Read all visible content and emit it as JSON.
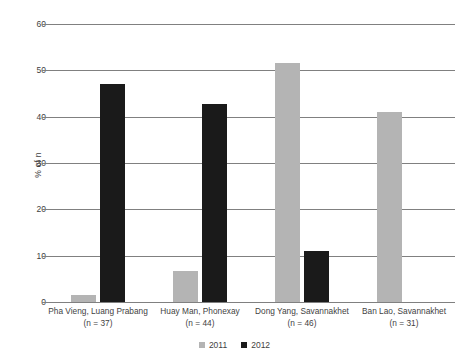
{
  "chart_data": {
    "type": "bar",
    "title": "",
    "xlabel": "",
    "ylabel": "% of n",
    "ylim": [
      0,
      60
    ],
    "yticks": [
      0,
      10,
      20,
      30,
      40,
      50,
      60
    ],
    "ytick_labels": [
      "0",
      "10",
      "20",
      "30",
      "40",
      "50",
      "60"
    ],
    "grid": true,
    "legend_position": "bottom-center",
    "categories": [
      "Pha Vieng, Luang Prabang\n(n = 37)",
      "Huay Man, Phonexay\n(n = 44)",
      "Dong Yang, Savannakhet\n(n = 46)",
      "Ban Lao, Savannakhet\n(n = 31)"
    ],
    "category_lines": [
      {
        "line1": "Pha Vieng, Luang Prabang",
        "line2": "(n = 37)"
      },
      {
        "line1": "Huay Man, Phonexay",
        "line2": "(n = 44)"
      },
      {
        "line1": "Dong Yang, Savannakhet",
        "line2": "(n = 46)"
      },
      {
        "line1": "Ban Lao, Savannakhet",
        "line2": "(n = 31)"
      }
    ],
    "series": [
      {
        "name": "2011",
        "color": "#b4b4b4",
        "values": [
          1.5,
          6.7,
          51.5,
          41.0
        ]
      },
      {
        "name": "2012",
        "color": "#1a1a1a",
        "values": [
          47.0,
          42.8,
          11.0,
          0
        ]
      }
    ]
  },
  "legend": {
    "items": [
      {
        "label": "2011",
        "color": "#b4b4b4"
      },
      {
        "label": "2012",
        "color": "#1a1a1a"
      }
    ]
  },
  "colors": {
    "series_2011": "#b4b4b4",
    "series_2012": "#1a1a1a",
    "gridline": "#808080",
    "text": "#3f3f3f",
    "background": "#ffffff"
  }
}
